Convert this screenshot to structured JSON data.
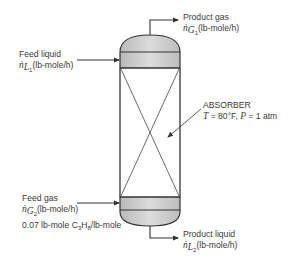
{
  "diagram": {
    "unit_label": "ABSORBER",
    "conditions": {
      "T_symbol": "T",
      "T_value": " = 80°F, ",
      "P_symbol": "P",
      "P_value": " = 1 atm"
    },
    "streams": {
      "feed_liquid": {
        "name": "Feed liquid",
        "var": "ṅ",
        "sub_main": "L",
        "sub_index": "1",
        "units": "(lb-mole/h)"
      },
      "product_gas": {
        "name": "Product gas",
        "var": "ṅ",
        "sub_main": "G",
        "sub_index": "1",
        "units": "(lb-mole/h)"
      },
      "feed_gas": {
        "name": "Feed gas",
        "var": "ṅ",
        "sub_main": "G",
        "sub_index": "2",
        "units": "(lb-mole/h)",
        "composition_prefix": "0.07 lb-mole C",
        "composition_sub1": "3",
        "composition_mid": "H",
        "composition_sub2": "8",
        "composition_suffix": "/lb-mole"
      },
      "product_liquid": {
        "name": "Product liquid",
        "var": "ṅ",
        "sub_main": "L",
        "sub_index": "2",
        "units": "(lb-mole/h)"
      }
    },
    "colors": {
      "line": "#333333",
      "band_fill": "#c8c8c8",
      "dome_fill": "#d4d4d4"
    }
  }
}
